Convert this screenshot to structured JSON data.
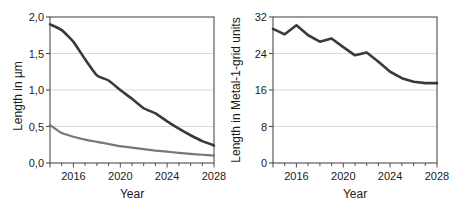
{
  "figure": {
    "background": "#ffffff",
    "panel_count": 2
  },
  "chart_data": [
    {
      "id": "left-panel",
      "type": "line",
      "title": "",
      "subtitle": "",
      "xlabel": "Year",
      "ylabel": "Length in µm",
      "xlim": [
        2014,
        2028
      ],
      "ylim": [
        0.0,
        2.0
      ],
      "xticks": [
        2014,
        2015,
        2016,
        2017,
        2018,
        2019,
        2020,
        2021,
        2022,
        2023,
        2024,
        2025,
        2026,
        2027,
        2028
      ],
      "xtick_labels": [
        "",
        "",
        "2016",
        "",
        "",
        "",
        "2020",
        "",
        "",
        "",
        "2024",
        "",
        "",
        "",
        "2028"
      ],
      "yticks": [
        0.0,
        0.5,
        1.0,
        1.5,
        2.0
      ],
      "ytick_labels": [
        "0,0",
        "0,5",
        "1,0",
        "1,5",
        "2,0"
      ],
      "grid": "horizontal",
      "legend": "none",
      "x": [
        2014,
        2015,
        2016,
        2017,
        2018,
        2019,
        2020,
        2021,
        2022,
        2023,
        2024,
        2025,
        2026,
        2027,
        2028
      ],
      "series": [
        {
          "name": "upper-curve",
          "color": "#3a3a3a",
          "width": 2.6,
          "values": [
            1.9,
            1.82,
            1.66,
            1.42,
            1.2,
            1.13,
            1.0,
            0.88,
            0.75,
            0.68,
            0.57,
            0.47,
            0.38,
            0.3,
            0.24
          ]
        },
        {
          "name": "lower-curve",
          "color": "#777777",
          "width": 2.2,
          "values": [
            0.52,
            0.41,
            0.36,
            0.32,
            0.29,
            0.26,
            0.23,
            0.21,
            0.19,
            0.17,
            0.155,
            0.14,
            0.125,
            0.113,
            0.1
          ]
        }
      ]
    },
    {
      "id": "right-panel",
      "type": "line",
      "title": "",
      "subtitle": "",
      "xlabel": "Year",
      "ylabel": "Length in Metal-1-grid units",
      "xlim": [
        2014,
        2028
      ],
      "ylim": [
        0,
        32
      ],
      "xticks": [
        2014,
        2015,
        2016,
        2017,
        2018,
        2019,
        2020,
        2021,
        2022,
        2023,
        2024,
        2025,
        2026,
        2027,
        2028
      ],
      "xtick_labels": [
        "",
        "",
        "2016",
        "",
        "",
        "",
        "2020",
        "",
        "",
        "",
        "2024",
        "",
        "",
        "",
        "2028"
      ],
      "yticks": [
        0,
        8,
        16,
        24,
        32
      ],
      "ytick_labels": [
        "0",
        "8",
        "16",
        "24",
        "32"
      ],
      "grid": "horizontal",
      "legend": "none",
      "x": [
        2014,
        2015,
        2016,
        2017,
        2018,
        2019,
        2020,
        2021,
        2022,
        2023,
        2024,
        2025,
        2026,
        2027,
        2028
      ],
      "series": [
        {
          "name": "metal1-grid-curve",
          "color": "#3a3a3a",
          "width": 2.6,
          "values": [
            29.4,
            28.2,
            30.2,
            28.0,
            26.6,
            27.3,
            25.4,
            23.6,
            24.2,
            22.2,
            20.0,
            18.6,
            17.8,
            17.5,
            17.5
          ]
        }
      ]
    }
  ],
  "left_panel": {
    "name": "left-chart",
    "ylabel": "Length in µm",
    "xlabel": "Year",
    "ytick_labels": [
      "2,0",
      "1,5",
      "1,0",
      "0,5",
      "0,0"
    ],
    "xtick_labels": [
      "2016",
      "2020",
      "2024",
      "2028"
    ]
  },
  "right_panel": {
    "name": "right-chart",
    "ylabel": "Length in Metal-1-grid units",
    "xlabel": "Year",
    "ytick_labels": [
      "32",
      "24",
      "16",
      "8",
      "0"
    ],
    "xtick_labels": [
      "2016",
      "2020",
      "2024",
      "2028"
    ]
  }
}
